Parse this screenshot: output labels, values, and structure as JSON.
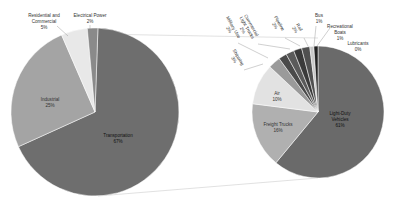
{
  "chart_data": [
    {
      "type": "pie",
      "title": "",
      "name": "primary",
      "categories": [
        "Transportation",
        "Industrial",
        "Residential and Commercial",
        "Electrical Power"
      ],
      "values": [
        67,
        25,
        5,
        2
      ],
      "labels": [
        "67%",
        "25%",
        "5%",
        "2%"
      ],
      "colors": [
        "#6e6e6e",
        "#a4a4a4",
        "#e8e8e8",
        "#8a8a8a"
      ]
    },
    {
      "type": "pie",
      "title": "",
      "name": "secondary (Transportation breakdown)",
      "categories": [
        "Light-Duty Vehicles",
        "Freight Trucks",
        "Air",
        "Shipping",
        "Military Use",
        "Commercial Light Trucks",
        "Pipeline",
        "Rail",
        "Bus",
        "Recreational Boats",
        "Lubricants"
      ],
      "values": [
        61,
        16,
        10,
        3,
        2,
        2,
        2,
        2,
        1,
        1,
        0
      ],
      "labels": [
        "61%",
        "16%",
        "10%",
        "3%",
        "2%",
        "2%",
        "2%",
        "2%",
        "1%",
        "1%",
        "0%"
      ],
      "colors": [
        "#6a6a6a",
        "#b0b0b0",
        "#e2e2e2",
        "#9a9a9a",
        "#4a4a4a",
        "#5a5a5a",
        "#3a3a3a",
        "#505050",
        "#c8c8c8",
        "#222222",
        "#f0f0f0"
      ]
    }
  ],
  "labels": {
    "transportation": "Transportation",
    "transportation_pct": "67%",
    "industrial": "Industrial",
    "industrial_pct": "25%",
    "residential_1": "Residential and",
    "residential_2": "Commercial",
    "residential_pct": "5%",
    "electrical": "Electrical Power",
    "electrical_pct": "2%",
    "ldv_1": "Light-Duty",
    "ldv_2": "Vehicles",
    "ldv_pct": "61%",
    "freight": "Freight Trucks",
    "freight_pct": "16%",
    "air": "Air",
    "air_pct": "10%",
    "shipping": "Shipping",
    "shipping_pct": "3%",
    "military": "Military Use",
    "military_pct": "2%",
    "clt_1": "Commercial",
    "clt_2": "Light Trucks",
    "clt_pct": "2%",
    "pipeline": "Pipeline",
    "pipeline_pct": "2%",
    "rail": "Rail",
    "rail_pct": "2%",
    "bus": "Bus",
    "bus_pct": "1%",
    "boats_1": "Recreational",
    "boats_2": "Boats",
    "boats_pct": "1%",
    "lubricants": "Lubricants",
    "lubricants_pct": "0%"
  }
}
